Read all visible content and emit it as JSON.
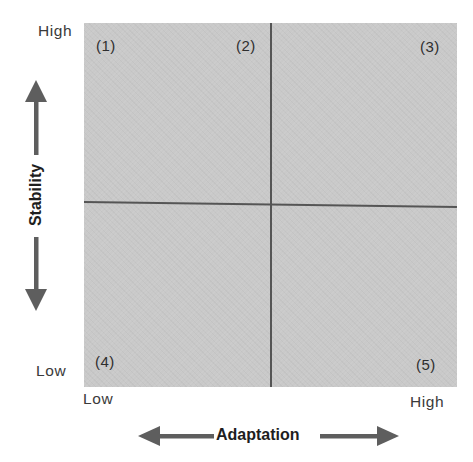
{
  "diagram": {
    "type": "quadrant-matrix",
    "y_axis": {
      "title": "Stability",
      "high_label": "High",
      "low_label": "Low",
      "arrow": "bidirectional-vertical"
    },
    "x_axis": {
      "title": "Adaptation",
      "high_label": "High",
      "low_label": "Low",
      "arrow": "bidirectional-horizontal"
    },
    "regions": [
      {
        "label": "(1)",
        "position": "top-left corner"
      },
      {
        "label": "(2)",
        "position": "top, left of center divider"
      },
      {
        "label": "(3)",
        "position": "top-right corner"
      },
      {
        "label": "(4)",
        "position": "bottom-left corner"
      },
      {
        "label": "(5)",
        "position": "bottom-right corner"
      }
    ],
    "colors": {
      "field": "#c9c9c9",
      "divider": "#555555",
      "arrow": "#5e5e5e",
      "text": "#2a2a2a"
    }
  }
}
